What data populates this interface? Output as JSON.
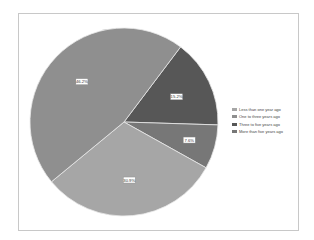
{
  "chart_data": {
    "type": "pie",
    "title": "",
    "series": [
      {
        "name": "Less than one year ago",
        "value": 30.9,
        "label": "30.9%",
        "color": "#a6a6a6"
      },
      {
        "name": "One to three years ago",
        "value": 46.2,
        "label": "46.2%",
        "color": "#8f8f8f"
      },
      {
        "name": "Three to five years ago",
        "value": 15.2,
        "label": "15.2%",
        "color": "#575757"
      },
      {
        "name": "More than five years ago",
        "value": 7.6,
        "label": "7.6%",
        "color": "#777777"
      }
    ],
    "start_angle_deg": 37,
    "direction": "clockwise",
    "legend_position": "right"
  }
}
